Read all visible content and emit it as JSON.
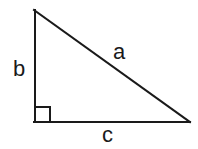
{
  "diagram": {
    "type": "right-triangle",
    "background_color": "#ffffff",
    "stroke_color": "#1a1a1a",
    "stroke_width": 2,
    "vertices": {
      "apex": {
        "x": 34,
        "y": 10
      },
      "right_angle": {
        "x": 35,
        "y": 122
      },
      "base_right": {
        "x": 190,
        "y": 122
      }
    },
    "right_angle_marker": {
      "present": true,
      "size": 15,
      "x": 35,
      "y": 107
    },
    "labels": {
      "hypotenuse": "a",
      "vertical_leg": "b",
      "horizontal_leg": "c"
    },
    "label_positions": {
      "hypotenuse": {
        "x": 113,
        "y": 41
      },
      "vertical_leg": {
        "x": 13,
        "y": 58
      },
      "horizontal_leg": {
        "x": 102,
        "y": 124
      }
    }
  }
}
